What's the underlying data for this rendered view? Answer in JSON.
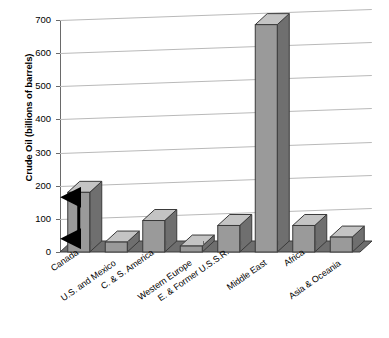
{
  "chart_data": {
    "type": "bar",
    "title": "",
    "xlabel": "",
    "ylabel": "Crude Oil (billions of barrels)",
    "ylim": [
      0,
      700
    ],
    "yticks": [
      0,
      100,
      200,
      300,
      400,
      500,
      600,
      700
    ],
    "grid": true,
    "legend": false,
    "style": "3d-bar",
    "categories": [
      "Canada",
      "U.S. and Mexico",
      "C. & S. America",
      "Western Europe",
      "E. & Former U.S.S.R.",
      "Middle East",
      "Africa",
      "Asia & Oceania"
    ],
    "values": [
      180,
      30,
      95,
      18,
      80,
      686,
      80,
      45
    ],
    "annotations": [
      {
        "name": "double-headed-arrow",
        "category": "Canada",
        "from_value": 40,
        "to_value": 165,
        "color": "#000000"
      }
    ]
  },
  "axis": {
    "y_title": "Crude Oil (billions of barrels)",
    "tick_labels": [
      "700",
      "600",
      "500",
      "400",
      "300",
      "200",
      "100",
      "0"
    ]
  },
  "colors": {
    "bar_front": "#9a9a9a",
    "bar_top": "#c4c4c4",
    "bar_side": "#6f6f6f",
    "bar_outline": "#3a3a3a",
    "floor": "#6e6e6e",
    "gridline": "#b9b9b9",
    "axis": "#6a6a6a",
    "text": "#000000",
    "annotation": "#000000"
  }
}
